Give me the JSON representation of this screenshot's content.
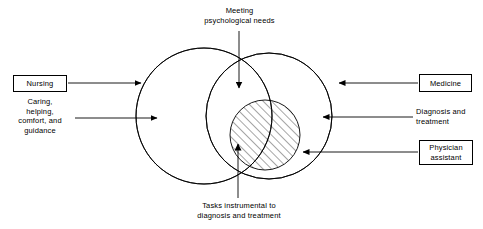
{
  "diagram": {
    "colors": {
      "stroke": "#000000",
      "background": "#ffffff",
      "hatch": "#000000"
    },
    "nodes": {
      "nursing": {
        "label": "Nursing",
        "detail": "Caring,\nhelping,\ncomfort, and\nguidance"
      },
      "medicine": {
        "label": "Medicine",
        "detail": "Diagnosis and\ntreatment"
      },
      "physician_assistant": {
        "label": "Physician\nassistant"
      }
    },
    "annotations": {
      "top": "Meeting\npsychological needs",
      "bottom": "Tasks instrumental to\ndiagnosis and treatment"
    },
    "shapes": {
      "left_circle": {
        "cx": 204,
        "cy": 116,
        "r": 68,
        "name": "nursing-domain-circle"
      },
      "right_circle": {
        "cx": 269,
        "cy": 116,
        "r": 63,
        "name": "medicine-domain-circle"
      },
      "hatched_circle": {
        "cx": 265,
        "cy": 135,
        "r": 35,
        "name": "shared-tasks-circle"
      }
    },
    "arrows": [
      {
        "name": "nursing-to-circle-arrow",
        "from": "Nursing",
        "direction": "right"
      },
      {
        "name": "caring-to-circle-arrow",
        "from": "Caring, helping, comfort, and guidance",
        "direction": "right"
      },
      {
        "name": "medicine-to-circle-arrow",
        "from": "Medicine",
        "direction": "left"
      },
      {
        "name": "diagnosis-to-circle-arrow",
        "from": "Diagnosis and treatment",
        "direction": "left"
      },
      {
        "name": "physician-assistant-to-overlap-arrow",
        "from": "Physician assistant",
        "direction": "left"
      },
      {
        "name": "meeting-needs-arrow",
        "from": "Meeting psychological needs",
        "direction": "down"
      },
      {
        "name": "tasks-arrow",
        "from": "Tasks instrumental to diagnosis and treatment",
        "direction": "up"
      }
    ]
  }
}
